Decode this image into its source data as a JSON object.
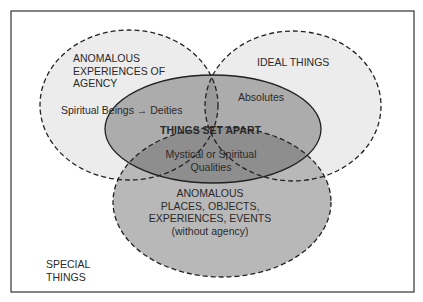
{
  "diagram": {
    "type": "venn",
    "frame_label": "SPECIAL THINGS",
    "frame_label_lines": [
      "SPECIAL",
      "THINGS"
    ],
    "sets": [
      {
        "id": "agency",
        "lines": [
          "ANOMALOUS",
          "EXPERIENCES OF",
          "AGENCY"
        ],
        "border": "dashed",
        "fill": "#ececec"
      },
      {
        "id": "ideal",
        "lines": [
          "IDEAL THINGS"
        ],
        "border": "dashed",
        "fill": "#ececec"
      },
      {
        "id": "places",
        "lines": [
          "ANOMALOUS",
          "PLACES, OBJECTS,",
          "EXPERIENCES, EVENTS",
          "(without agency)"
        ],
        "border": "dashed",
        "fill": "#b4b4b4"
      },
      {
        "id": "set_apart",
        "label": "THINGS SET APART",
        "border": "solid",
        "fill": "#a0a0a0"
      }
    ],
    "region_labels": {
      "spiritual_beings": "Spiritual Beings → Deities",
      "absolutes": "Absolutes",
      "mystical": [
        "Mystical or Spiritual",
        "Qualities"
      ]
    },
    "colors": {
      "outline": "#333333",
      "light_fill": "#ececec",
      "mid_fill": "#b8b8b8",
      "dark_fill": "#8e8e8e",
      "text": "#2a2a2a"
    }
  }
}
